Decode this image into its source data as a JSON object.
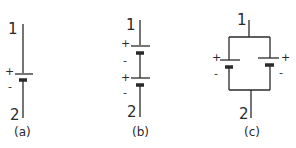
{
  "diagram": {
    "type": "battery-circuits",
    "panels": [
      {
        "id": "a",
        "caption": "(a)",
        "terminal_top": "1",
        "terminal_bottom": "2",
        "configuration": "single",
        "cells": [
          {
            "plus": "+",
            "minus": "-"
          }
        ]
      },
      {
        "id": "b",
        "caption": "(b)",
        "terminal_top": "1",
        "terminal_bottom": "2",
        "configuration": "series",
        "cells": [
          {
            "plus": "+",
            "minus": "-"
          },
          {
            "plus": "+",
            "minus": "-"
          }
        ]
      },
      {
        "id": "c",
        "caption": "(c)",
        "terminal_top": "1",
        "terminal_bottom": "2",
        "configuration": "parallel",
        "cells": [
          {
            "plus": "+",
            "minus": "-"
          },
          {
            "plus": "+",
            "minus": "-"
          }
        ]
      }
    ],
    "colors": {
      "ink": "#2a2a2a",
      "background": "#ffffff"
    }
  }
}
